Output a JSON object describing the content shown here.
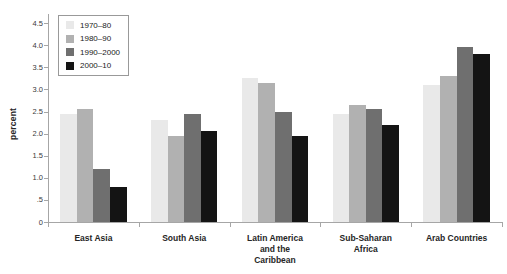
{
  "chart_data": {
    "type": "bar",
    "title": "",
    "xlabel": "",
    "ylabel": "percent",
    "ylim": [
      0,
      4.5
    ],
    "grid": false,
    "legend_position": "top-left",
    "ytick_values": [
      0,
      0.5,
      1.0,
      1.5,
      2.0,
      2.5,
      3.0,
      3.5,
      4.0,
      4.5
    ],
    "ytick_labels": [
      "0",
      ".5",
      "1.0",
      "1.5",
      "2.0",
      "2.5",
      "3.0",
      "3.5",
      "4.0",
      "4.5"
    ],
    "categories": [
      "East Asia",
      "South Asia",
      "Latin America and the Caribbean",
      "Sub-Saharan Africa",
      "Arab Countries"
    ],
    "category_label_lines": [
      [
        "East Asia"
      ],
      [
        "South Asia"
      ],
      [
        "Latin America",
        "and the",
        "Caribbean"
      ],
      [
        "Sub-Saharan",
        "Africa"
      ],
      [
        "Arab Countries"
      ]
    ],
    "series": [
      {
        "name": "1970–80",
        "color": "#e9e9e9",
        "values": [
          2.45,
          2.3,
          3.25,
          2.45,
          3.1
        ]
      },
      {
        "name": "1980–90",
        "color": "#b1b1b1",
        "values": [
          2.55,
          1.95,
          3.15,
          2.65,
          3.3
        ]
      },
      {
        "name": "1990–2000",
        "color": "#6f6f6f",
        "values": [
          1.2,
          2.45,
          2.5,
          2.55,
          3.95
        ]
      },
      {
        "name": "2000–10",
        "color": "#141414",
        "values": [
          0.8,
          2.05,
          1.95,
          2.2,
          3.8
        ]
      }
    ],
    "axis_color": "#a6a6a6",
    "tick_label_color": "#3a3a3a",
    "category_label_color": "#262626",
    "background_color": "#ffffff"
  }
}
